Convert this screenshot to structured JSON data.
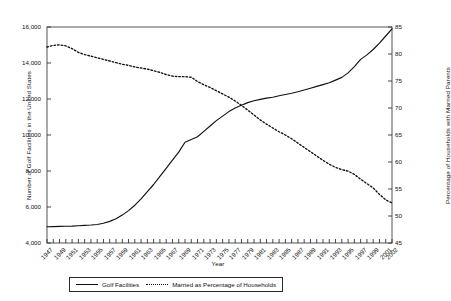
{
  "chart_data": {
    "type": "line",
    "title": "",
    "xlabel": "Year",
    "ylabel": "Number of Golf Facilities in the United States",
    "ylabel_secondary": "Percentage of Households with Married Parents",
    "grid": false,
    "legend_position": "bottom",
    "xlim": [
      1947,
      2002
    ],
    "ylim": [
      4000,
      16000
    ],
    "ylim_secondary": [
      45,
      85
    ],
    "x_tick_labels": [
      "1947",
      "1949",
      "1951",
      "1953",
      "1955",
      "1957",
      "1959",
      "1961",
      "1963",
      "1965",
      "1967",
      "1969",
      "1971",
      "1973",
      "1975",
      "1977",
      "1979",
      "1981",
      "1983",
      "1985",
      "1987",
      "1989",
      "1991",
      "1993",
      "1995",
      "1997",
      "1999",
      "2001",
      "2002"
    ],
    "y_tick_labels_left": [
      "4,000",
      "6,000",
      "8,000",
      "10,000",
      "12,000",
      "14,000",
      "16,000"
    ],
    "y_tick_values_left": [
      4000,
      6000,
      8000,
      10000,
      12000,
      14000,
      16000
    ],
    "y_tick_labels_right": [
      "45",
      "50",
      "55",
      "60",
      "65",
      "70",
      "75",
      "80",
      "85"
    ],
    "y_tick_values_right": [
      45,
      50,
      55,
      60,
      65,
      70,
      75,
      80,
      85
    ],
    "x": [
      1947,
      1948,
      1949,
      1950,
      1951,
      1952,
      1953,
      1954,
      1955,
      1956,
      1957,
      1958,
      1959,
      1960,
      1961,
      1962,
      1963,
      1964,
      1965,
      1966,
      1967,
      1968,
      1969,
      1970,
      1971,
      1972,
      1973,
      1974,
      1975,
      1976,
      1977,
      1978,
      1979,
      1980,
      1981,
      1982,
      1983,
      1984,
      1985,
      1986,
      1987,
      1988,
      1989,
      1990,
      1991,
      1992,
      1993,
      1994,
      1995,
      1996,
      1997,
      1998,
      1999,
      2000,
      2001,
      2002
    ],
    "series": [
      {
        "name": "Golf Facilities",
        "axis": "left",
        "style": "solid",
        "color": "#111111",
        "values": [
          4900,
          4910,
          4920,
          4930,
          4940,
          4960,
          4980,
          5000,
          5030,
          5100,
          5200,
          5350,
          5550,
          5800,
          6100,
          6450,
          6850,
          7250,
          7700,
          8150,
          8600,
          9050,
          9600,
          9750,
          9900,
          10200,
          10500,
          10800,
          11050,
          11300,
          11500,
          11650,
          11800,
          11900,
          11980,
          12050,
          12100,
          12180,
          12250,
          12320,
          12400,
          12500,
          12600,
          12700,
          12800,
          12900,
          13050,
          13200,
          13450,
          13800,
          14200,
          14450,
          14750,
          15100,
          15500,
          15900
        ]
      },
      {
        "name": "Married as Percentage of Households",
        "axis": "right",
        "style": "dotted",
        "color": "#111111",
        "values": [
          81.3,
          81.6,
          81.7,
          81.5,
          81.0,
          80.3,
          79.9,
          79.6,
          79.3,
          79.0,
          78.7,
          78.4,
          78.1,
          77.9,
          77.6,
          77.4,
          77.2,
          76.9,
          76.6,
          76.2,
          75.9,
          75.8,
          75.8,
          75.7,
          74.9,
          74.3,
          73.8,
          73.2,
          72.6,
          72.0,
          71.3,
          70.5,
          69.6,
          68.7,
          67.8,
          67.0,
          66.3,
          65.6,
          65.0,
          64.3,
          63.5,
          62.7,
          61.9,
          61.1,
          60.3,
          59.6,
          59.0,
          58.6,
          58.3,
          57.7,
          56.8,
          56.0,
          55.2,
          54.0,
          53.0,
          52.4
        ]
      }
    ]
  },
  "legend": {
    "entries": [
      {
        "label": "Golf Facilities",
        "style": "solid"
      },
      {
        "label": "Married as Percentage of Households",
        "style": "dotted"
      }
    ]
  }
}
